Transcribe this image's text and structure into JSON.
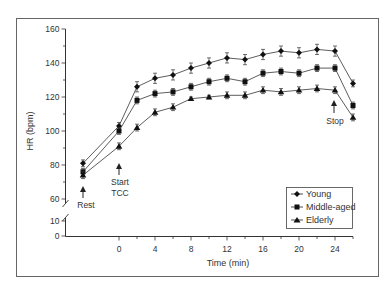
{
  "chart_data": {
    "type": "line",
    "title": "",
    "xlabel": "Time (min)",
    "ylabel": "HR (bpm)",
    "x": [
      -4,
      0,
      2,
      4,
      6,
      8,
      10,
      12,
      14,
      16,
      18,
      20,
      22,
      24,
      26
    ],
    "x_ticks": [
      0,
      4,
      8,
      12,
      16,
      20,
      24
    ],
    "y_ticks": [
      0,
      10,
      60,
      80,
      100,
      120,
      140,
      160
    ],
    "ylim": [
      0,
      160
    ],
    "y_axis_break": [
      10,
      60
    ],
    "grid": false,
    "legend_position": "lower right",
    "series": [
      {
        "name": "Young",
        "marker": "diamond",
        "values": [
          81,
          103,
          126,
          131,
          133,
          137,
          140,
          143,
          142,
          145,
          147,
          146,
          148,
          147,
          128
        ],
        "error": [
          2,
          2,
          3,
          3,
          3,
          3,
          3,
          3,
          3,
          3,
          3,
          3,
          3,
          3,
          2
        ]
      },
      {
        "name": "Middle-aged",
        "marker": "square",
        "values": [
          76,
          100,
          118,
          122,
          123,
          126,
          129,
          131,
          129,
          134,
          135,
          134,
          137,
          137,
          115
        ],
        "error": [
          2,
          2,
          2,
          2,
          2,
          2,
          2,
          2,
          2,
          2,
          2,
          2,
          2,
          2,
          2
        ]
      },
      {
        "name": "Elderly",
        "marker": "triangle",
        "values": [
          74,
          91,
          102,
          111,
          114,
          119,
          120,
          121,
          121,
          124,
          123,
          124,
          125,
          124,
          108
        ],
        "error": [
          2,
          2,
          2,
          2,
          2,
          1,
          1,
          2,
          2,
          2,
          2,
          2,
          2,
          2,
          2
        ]
      }
    ],
    "annotations": [
      {
        "text": "Rest",
        "x": -4
      },
      {
        "text": "Start TCC",
        "x": 0
      },
      {
        "text": "Stop",
        "x": 24
      }
    ]
  },
  "labels": {
    "ylabel": "HR (bpm)",
    "xlabel": "Time (min)",
    "rest": "Rest",
    "start_line1": "Start",
    "start_line2": "TCC",
    "stop": "Stop"
  },
  "legend": {
    "items": [
      {
        "label": "Young"
      },
      {
        "label": "Middle-aged"
      },
      {
        "label": "Elderly"
      }
    ]
  }
}
